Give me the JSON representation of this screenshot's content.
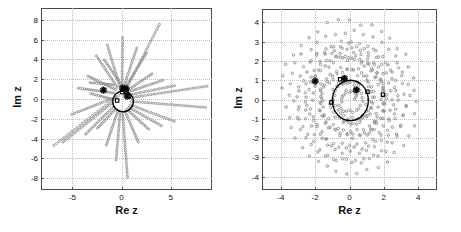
{
  "figure": {
    "background": "#ffffff",
    "marker_color": "#8c8c8c",
    "highlight_color": "#000000",
    "grid_color": "#bdbdbd",
    "axis_color": "#4a4a4a"
  },
  "chart_data": [
    {
      "panel": "left",
      "type": "scatter",
      "title": "",
      "xlabel": "Re z",
      "ylabel": "Im z",
      "xlim": [
        -8.2,
        9.2
      ],
      "ylim": [
        -9.2,
        9.2
      ],
      "xticks": [
        -5,
        0,
        5
      ],
      "yticks": [
        -8,
        -6,
        -4,
        -2,
        0,
        2,
        4,
        6,
        8
      ],
      "grid": true,
      "legend": "none",
      "description": "Dotted gray rays radiating outward from near the origin; black unit circle and star/square markers near the origin",
      "rays": [
        {
          "x0": -0.3,
          "y0": 0.35,
          "x1": -6.9,
          "y1": -4.7,
          "n": 26
        },
        {
          "x0": -0.55,
          "y0": 0.2,
          "x1": -5.05,
          "y1": -1.55,
          "n": 20
        },
        {
          "x0": -0.75,
          "y0": 0.6,
          "x1": -4.4,
          "y1": 1.1,
          "n": 18
        },
        {
          "x0": -0.6,
          "y0": 0.95,
          "x1": -3.4,
          "y1": 2.3,
          "n": 16
        },
        {
          "x0": -0.45,
          "y0": 1.2,
          "x1": -2.55,
          "y1": 4.35,
          "n": 16
        },
        {
          "x0": -0.2,
          "y0": 1.35,
          "x1": -1.45,
          "y1": 5.45,
          "n": 17
        },
        {
          "x0": 0.05,
          "y0": 1.4,
          "x1": 0.1,
          "y1": 6.2,
          "n": 18
        },
        {
          "x0": 0.25,
          "y0": 1.35,
          "x1": 1.55,
          "y1": 5.15,
          "n": 16
        },
        {
          "x0": 0.45,
          "y0": 1.3,
          "x1": 2.55,
          "y1": 4.65,
          "n": 16
        },
        {
          "x0": 0.55,
          "y0": 1.15,
          "x1": 3.85,
          "y1": 7.55,
          "n": 24
        },
        {
          "x0": 0.7,
          "y0": 0.95,
          "x1": 3.1,
          "y1": 2.55,
          "n": 14
        },
        {
          "x0": 0.8,
          "y0": 0.75,
          "x1": 4.2,
          "y1": 1.9,
          "n": 16
        },
        {
          "x0": 0.95,
          "y0": 0.45,
          "x1": 5.4,
          "y1": 1.35,
          "n": 18
        },
        {
          "x0": 1.0,
          "y0": 0.15,
          "x1": 8.7,
          "y1": 1.3,
          "n": 28
        },
        {
          "x0": 1.0,
          "y0": -0.25,
          "x1": 8.55,
          "y1": -0.85,
          "n": 28
        },
        {
          "x0": 0.9,
          "y0": -0.6,
          "x1": 5.35,
          "y1": -2.25,
          "n": 18
        },
        {
          "x0": 0.75,
          "y0": -0.85,
          "x1": 4.05,
          "y1": -2.7,
          "n": 16
        },
        {
          "x0": 0.55,
          "y0": -1.05,
          "x1": 2.75,
          "y1": -3.05,
          "n": 14
        },
        {
          "x0": 0.35,
          "y0": -1.25,
          "x1": 1.7,
          "y1": -4.35,
          "n": 16
        },
        {
          "x0": 0.1,
          "y0": -1.35,
          "x1": 0.6,
          "y1": -7.9,
          "n": 26
        },
        {
          "x0": -0.15,
          "y0": -1.35,
          "x1": -0.55,
          "y1": -6.15,
          "n": 20
        },
        {
          "x0": -0.4,
          "y0": -1.25,
          "x1": -1.55,
          "y1": -4.65,
          "n": 16
        },
        {
          "x0": -0.65,
          "y0": -1.05,
          "x1": -2.45,
          "y1": -2.95,
          "n": 13
        },
        {
          "x0": -0.85,
          "y0": -0.8,
          "x1": -3.65,
          "y1": -3.55,
          "n": 16
        },
        {
          "x0": -1.0,
          "y0": -0.45,
          "x1": -5.95,
          "y1": -4.35,
          "n": 22
        },
        {
          "x0": -1.0,
          "y0": 0.0,
          "x1": -3.15,
          "y1": 0.55,
          "n": 12
        },
        {
          "x0": -0.85,
          "y0": 1.45,
          "x1": -3.2,
          "y1": 1.65,
          "n": 12
        },
        {
          "x0": -0.1,
          "y0": 1.55,
          "x1": -1.75,
          "y1": 3.95,
          "n": 14
        }
      ],
      "unit_circle": {
        "cx": 0.15,
        "cy": -0.25,
        "r": 1.05
      },
      "star_markers": [
        {
          "x": -1.85,
          "y": 0.9
        },
        {
          "x": 0.1,
          "y": 1.1
        },
        {
          "x": 0.45,
          "y": 1.05
        },
        {
          "x": 0.55,
          "y": 0.3
        }
      ],
      "square_markers": [
        {
          "x": 0.05,
          "y": 0.7
        },
        {
          "x": 0.5,
          "y": 0.75
        },
        {
          "x": -0.45,
          "y": -0.15
        },
        {
          "x": 0.75,
          "y": 0.25
        }
      ]
    },
    {
      "panel": "right",
      "type": "scatter",
      "title": "",
      "xlabel": "Re z",
      "ylabel": "Im z",
      "xlim": [
        -5.1,
        5.1
      ],
      "ylim": [
        -4.7,
        4.7
      ],
      "xticks": [
        -4,
        -2,
        0,
        2,
        4
      ],
      "yticks": [
        -4,
        -3,
        -2,
        -1,
        0,
        1,
        2,
        3,
        4
      ],
      "grid": true,
      "legend": "none",
      "description": "Gray dots arranged in several concentric spiral rings around the origin; black unit circle with star and square markers",
      "spirals": [
        {
          "r0": 0.35,
          "r1": 1.1,
          "theta0": 0.0,
          "turns": 2.0,
          "n": 46,
          "jitter": 0.1
        },
        {
          "r0": 0.9,
          "r1": 1.95,
          "theta0": 1.1,
          "turns": 2.0,
          "n": 58,
          "jitter": 0.12
        },
        {
          "r0": 1.7,
          "r1": 2.7,
          "theta0": 2.3,
          "turns": 2.0,
          "n": 66,
          "jitter": 0.13
        },
        {
          "r0": 2.4,
          "r1": 3.35,
          "theta0": 0.6,
          "turns": 2.0,
          "n": 74,
          "jitter": 0.14
        },
        {
          "r0": 3.1,
          "r1": 4.15,
          "theta0": 3.0,
          "turns": 2.0,
          "n": 80,
          "jitter": 0.15
        },
        {
          "r0": 1.2,
          "r1": 2.3,
          "theta0": 4.4,
          "turns": 1.6,
          "n": 52,
          "jitter": 0.12
        },
        {
          "r0": 2.0,
          "r1": 3.0,
          "theta0": 5.3,
          "turns": 1.6,
          "n": 60,
          "jitter": 0.13
        }
      ],
      "unit_circle": {
        "cx": 0.05,
        "cy": -0.05,
        "r": 1.05
      },
      "star_markers": [
        {
          "x": -2.0,
          "y": 0.95
        },
        {
          "x": -0.3,
          "y": 1.1
        },
        {
          "x": 0.4,
          "y": 0.5
        }
      ],
      "square_markers": [
        {
          "x": -0.55,
          "y": 1.05
        },
        {
          "x": -1.05,
          "y": -0.15
        },
        {
          "x": 1.05,
          "y": 0.4
        },
        {
          "x": 1.95,
          "y": 0.25
        }
      ]
    }
  ]
}
